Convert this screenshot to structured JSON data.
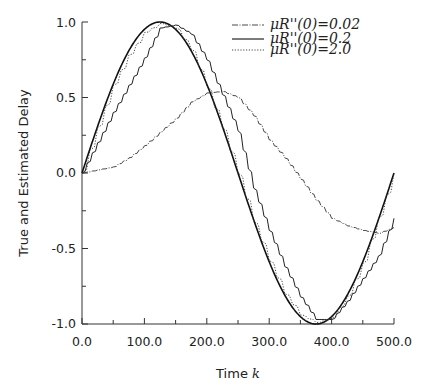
{
  "chart_data": {
    "type": "line",
    "title": "",
    "xlabel": "Time k",
    "ylabel": "True and Estimated Delay",
    "xlim": [
      0,
      500
    ],
    "ylim": [
      -1.0,
      1.0
    ],
    "xticks": [
      "0.0",
      "100.0",
      "200.0",
      "300.0",
      "400.0",
      "500.0"
    ],
    "yticks": [
      "1.0",
      "0.5",
      "0.0",
      "-0.5",
      "-1.0"
    ],
    "grid": false,
    "legend_position": "top-right",
    "series": [
      {
        "name": "True delay",
        "style": "solid-thick",
        "x": [
          0,
          25,
          50,
          75,
          100,
          125,
          150,
          175,
          200,
          225,
          250,
          275,
          300,
          325,
          350,
          375,
          400,
          425,
          450,
          475,
          500
        ],
        "values": [
          0.0,
          0.31,
          0.59,
          0.81,
          0.95,
          1.0,
          0.95,
          0.81,
          0.59,
          0.31,
          0.0,
          -0.31,
          -0.59,
          -0.81,
          -0.95,
          -1.0,
          -0.95,
          -0.81,
          -0.59,
          -0.31,
          0.0
        ]
      },
      {
        "name": "μR''(0)=0.02",
        "style": "dash-dot",
        "x": [
          0,
          25,
          50,
          75,
          100,
          125,
          150,
          175,
          200,
          225,
          250,
          275,
          300,
          325,
          350,
          375,
          400,
          425,
          450,
          475,
          500
        ],
        "values": [
          0.0,
          0.02,
          0.04,
          0.1,
          0.18,
          0.27,
          0.36,
          0.47,
          0.53,
          0.54,
          0.5,
          0.38,
          0.22,
          0.1,
          -0.04,
          -0.18,
          -0.3,
          -0.35,
          -0.38,
          -0.4,
          -0.36
        ]
      },
      {
        "name": "μR''(0)=0.2",
        "style": "solid-thin",
        "x": [
          0,
          25,
          50,
          75,
          100,
          125,
          150,
          175,
          200,
          225,
          250,
          275,
          300,
          325,
          350,
          375,
          400,
          425,
          450,
          475,
          500
        ],
        "values": [
          0.0,
          0.2,
          0.4,
          0.58,
          0.76,
          0.96,
          0.98,
          0.92,
          0.75,
          0.52,
          0.28,
          -0.1,
          -0.38,
          -0.62,
          -0.82,
          -0.97,
          -0.97,
          -0.85,
          -0.7,
          -0.55,
          -0.3
        ]
      },
      {
        "name": "μR''(0)=2.0",
        "style": "dotted",
        "x": [
          0,
          25,
          50,
          75,
          100,
          125,
          150,
          175,
          200,
          225,
          250,
          275,
          300,
          325,
          350,
          375,
          400,
          425,
          450,
          475,
          500
        ],
        "values": [
          0.0,
          0.3,
          0.58,
          0.78,
          0.93,
          0.99,
          0.96,
          0.82,
          0.57,
          0.3,
          0.0,
          -0.32,
          -0.58,
          -0.8,
          -0.94,
          -0.99,
          -0.96,
          -0.82,
          -0.6,
          -0.3,
          0.0
        ]
      }
    ],
    "legend": [
      {
        "label": "μR''(0)=0.02",
        "style": "dash-dot"
      },
      {
        "label": "μR''(0)=0.2",
        "style": "solid-thin"
      },
      {
        "label": "μR''(0)=2.0",
        "style": "dotted"
      }
    ]
  },
  "labels": {
    "xlabel_text": "Time ",
    "xlabel_var": "k",
    "ylabel": "True and Estimated Delay",
    "legend_0": "μR''(0)=0.02",
    "legend_1": "μR''(0)=0.2",
    "legend_2": "μR''(0)=2.0",
    "xtick_0": "0.0",
    "xtick_1": "100.0",
    "xtick_2": "200.0",
    "xtick_3": "300.0",
    "xtick_4": "400.0",
    "xtick_5": "500.0",
    "ytick_0": "1.0",
    "ytick_1": "0.5",
    "ytick_2": "0.0",
    "ytick_3": "-0.5",
    "ytick_4": "-1.0"
  }
}
